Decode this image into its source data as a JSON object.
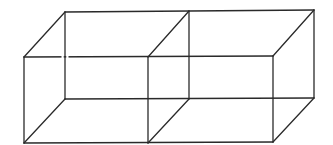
{
  "figure": {
    "stroke_color": "#2a2a2a",
    "background": "#ffffff",
    "vertices": {
      "front_left_top": [
        24,
        57
      ],
      "front_left_bottom": [
        24,
        143
      ],
      "front_mid_top": [
        148,
        57
      ],
      "front_mid_bottom": [
        148,
        143
      ],
      "front_right_top": [
        273,
        56
      ],
      "front_right_bottom": [
        273,
        142
      ],
      "back_left_top": [
        65,
        12
      ],
      "back_left_bottom": [
        65,
        99
      ],
      "back_mid_top": [
        189,
        11
      ],
      "back_mid_bottom": [
        189,
        99
      ],
      "back_right_top": [
        314,
        10
      ],
      "back_right_bottom": [
        314,
        98
      ]
    },
    "edges": [
      [
        "front_left_top",
        "front_right_top"
      ],
      [
        "front_left_bottom",
        "front_right_bottom"
      ],
      [
        "front_left_top",
        "front_left_bottom"
      ],
      [
        "front_mid_top",
        "front_mid_bottom"
      ],
      [
        "front_right_top",
        "front_right_bottom"
      ],
      [
        "back_left_top",
        "back_right_top"
      ],
      [
        "back_left_bottom",
        "back_right_bottom"
      ],
      [
        "back_left_top",
        "back_left_bottom"
      ],
      [
        "back_mid_top",
        "back_mid_bottom"
      ],
      [
        "back_right_top",
        "back_right_bottom"
      ],
      [
        "front_left_top",
        "back_left_top"
      ],
      [
        "front_left_bottom",
        "back_left_bottom"
      ],
      [
        "front_mid_top",
        "back_mid_top"
      ],
      [
        "front_mid_bottom",
        "back_mid_bottom"
      ],
      [
        "front_right_top",
        "back_right_top"
      ],
      [
        "front_right_bottom",
        "back_right_bottom"
      ]
    ]
  }
}
